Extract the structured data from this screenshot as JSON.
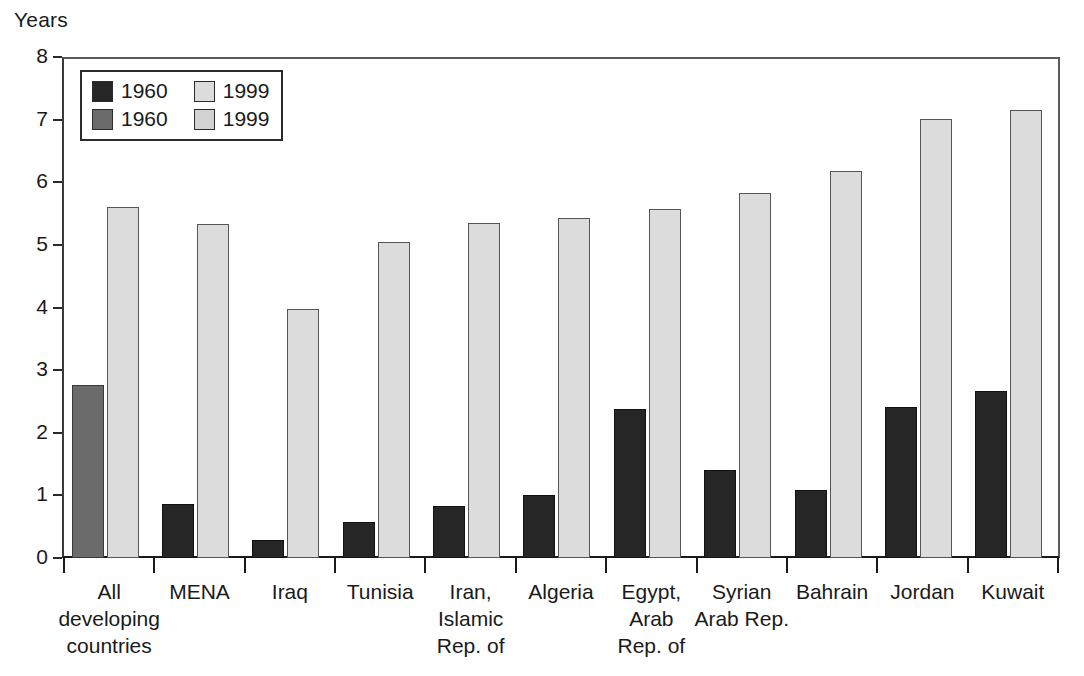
{
  "chart_data": {
    "type": "bar",
    "title": "",
    "xlabel": "",
    "ylabel": "Years",
    "ylim": [
      0,
      8
    ],
    "yticks": [
      "0",
      "1",
      "2",
      "3",
      "4",
      "5",
      "6",
      "7",
      "8"
    ],
    "grid": false,
    "legend_position": "top-left-inside",
    "categories": [
      "All\ndeveloping\ncountries",
      "MENA",
      "Iraq",
      "Tunisia",
      "Iran,\nIslamic\nRep. of",
      "Algeria",
      "Egypt,\nArab\nRep. of",
      "Syrian\nArab Rep.",
      "Bahrain",
      "Jordan",
      "Kuwait"
    ],
    "series": [
      {
        "name": "1960",
        "values": [
          2.76,
          0.87,
          0.28,
          0.58,
          0.83,
          1.01,
          2.38,
          1.4,
          1.09,
          2.41,
          2.67
        ]
      },
      {
        "name": "1999",
        "values": [
          5.6,
          5.33,
          3.97,
          5.05,
          5.35,
          5.43,
          5.57,
          5.83,
          6.18,
          7.01,
          7.16
        ]
      }
    ],
    "series_styles": [
      "1960-medium",
      "1960-dark",
      "1960-dark",
      "1960-dark",
      "1960-dark",
      "1960-dark",
      "1960-dark",
      "1960-dark",
      "1960-dark",
      "1960-dark",
      "1960-dark"
    ],
    "colors": {
      "1960_dark": "#262626",
      "1960_medium": "#6b6b6b",
      "1999_light": "#dcdcdc",
      "1999_light2": "#d2d2d2",
      "axis": "#1a1a1a",
      "background": "#ffffff"
    }
  },
  "legend": {
    "entries": [
      {
        "label": "1960",
        "swatch": "#262626",
        "style": "s1960-dark"
      },
      {
        "label": "1999",
        "swatch": "#dcdcdc",
        "style": "s1999-light"
      },
      {
        "label": "1960",
        "swatch": "#6b6b6b",
        "style": "s1960-medium"
      },
      {
        "label": "1999",
        "swatch": "#d2d2d2",
        "style": "s1999-light2"
      }
    ]
  }
}
